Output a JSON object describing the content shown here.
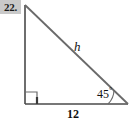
{
  "figure": {
    "problem_number": "22.",
    "shape": "right-triangle",
    "background_color": "#ffffff",
    "stroke_color": "#4a4a4a",
    "number_box_color": "#c9c9c9",
    "text_color": "#111111",
    "labels": {
      "hypotenuse": "h",
      "angle_value": "45",
      "angle_degree_symbol": "°",
      "base": "12"
    },
    "markers": {
      "right_angle": "right-angle-square",
      "angle_arc": "angle-arc-45",
      "tick": "base-tick-mark"
    },
    "geometry": {
      "apex": [
        25,
        5
      ],
      "bottom_left": [
        25,
        104
      ],
      "bottom_right": [
        128,
        104
      ]
    }
  }
}
